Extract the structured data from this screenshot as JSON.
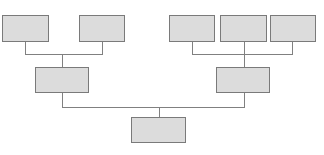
{
  "diagram": {
    "type": "tree",
    "colors": {
      "node_fill": "#dcdcdc",
      "node_border": "#7a7a7a",
      "connector": "#808080",
      "background": "#ffffff"
    },
    "nodes": [
      {
        "id": "n1",
        "level": 2,
        "label": "",
        "x": 2,
        "y": 15,
        "w": 47,
        "h": 27
      },
      {
        "id": "n2",
        "level": 2,
        "label": "",
        "x": 79,
        "y": 15,
        "w": 46,
        "h": 27
      },
      {
        "id": "n3",
        "level": 2,
        "label": "",
        "x": 169,
        "y": 15,
        "w": 46,
        "h": 27
      },
      {
        "id": "n4",
        "level": 2,
        "label": "",
        "x": 220,
        "y": 15,
        "w": 47,
        "h": 27
      },
      {
        "id": "n5",
        "level": 2,
        "label": "",
        "x": 270,
        "y": 15,
        "w": 46,
        "h": 27
      },
      {
        "id": "n6",
        "level": 1,
        "label": "",
        "x": 35,
        "y": 67,
        "w": 54,
        "h": 26
      },
      {
        "id": "n7",
        "level": 1,
        "label": "",
        "x": 216,
        "y": 67,
        "w": 54,
        "h": 26
      },
      {
        "id": "n8",
        "level": 0,
        "label": "",
        "x": 131,
        "y": 117,
        "w": 55,
        "h": 26
      }
    ],
    "edges": [
      {
        "from": "n1",
        "to": "n6"
      },
      {
        "from": "n2",
        "to": "n6"
      },
      {
        "from": "n3",
        "to": "n7"
      },
      {
        "from": "n4",
        "to": "n7"
      },
      {
        "from": "n5",
        "to": "n7"
      },
      {
        "from": "n6",
        "to": "n8"
      },
      {
        "from": "n7",
        "to": "n8"
      }
    ]
  }
}
